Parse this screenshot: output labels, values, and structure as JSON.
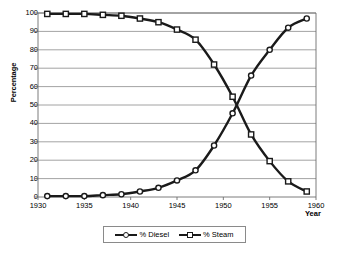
{
  "chart_data": {
    "type": "line",
    "title": "",
    "subtitle": "",
    "xlabel": "Year",
    "ylabel": "Percentage",
    "xlim": [
      1930,
      1960
    ],
    "ylim": [
      0,
      100
    ],
    "xticks": [
      1930,
      1935,
      1940,
      1945,
      1950,
      1955,
      1960
    ],
    "yticks": [
      0,
      10,
      20,
      30,
      40,
      50,
      60,
      70,
      80,
      90,
      100
    ],
    "grid": "horizontal",
    "legend_position": "bottom-center",
    "x": [
      1931,
      1933,
      1935,
      1937,
      1939,
      1941,
      1943,
      1945,
      1947,
      1949,
      1951,
      1953,
      1955,
      1957,
      1959
    ],
    "series": [
      {
        "name": "% Diesel",
        "marker": "circle",
        "color": "#1a1a1a",
        "values": [
          0.5,
          0.5,
          0.5,
          1,
          1.5,
          3,
          5,
          9,
          14.5,
          28,
          45.5,
          66,
          80,
          92,
          97
        ]
      },
      {
        "name": "% Steam",
        "marker": "square",
        "color": "#1a1a1a",
        "values": [
          99.5,
          99.5,
          99.5,
          99,
          98.5,
          97,
          95,
          91,
          85.5,
          72,
          54.5,
          34,
          19.5,
          8.5,
          3
        ]
      }
    ],
    "annotations": []
  },
  "axis": {
    "y_title": "Percentage",
    "x_title": "Year",
    "y_tick_labels": [
      "100",
      "90",
      "80",
      "70",
      "60",
      "50",
      "40",
      "30",
      "20",
      "10",
      "0"
    ],
    "x_tick_labels": [
      "1930",
      "1935",
      "1940",
      "1945",
      "1950",
      "1955",
      "1960"
    ]
  },
  "legend": {
    "items": [
      {
        "label": "% Diesel",
        "marker": "circle-marker-icon"
      },
      {
        "label": "% Steam",
        "marker": "square-marker-icon"
      }
    ]
  },
  "colors": {
    "line": "#1a1a1a",
    "grid": "#8c8c8c",
    "axis": "#6e6e6e",
    "background": "#ffffff",
    "marker_fill": "#ffffff"
  }
}
